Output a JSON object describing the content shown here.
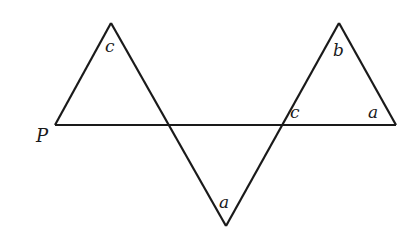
{
  "diagram": {
    "type": "geometry",
    "stroke_color": "#1a1a1a",
    "background": "#ffffff",
    "points": {
      "P": [
        55,
        125
      ],
      "left_apex": [
        111,
        23
      ],
      "left_cross": [
        168,
        125
      ],
      "bottom_vertex": [
        226,
        226
      ],
      "right_cross": [
        284,
        125
      ],
      "right_apex": [
        339,
        23
      ],
      "right_end": [
        396,
        125
      ]
    },
    "labels": {
      "point_p": "P",
      "left_apex_angle": "c",
      "bottom_angle": "a",
      "right_cross_angle": "c",
      "right_apex_angle": "b",
      "right_end_angle": "a"
    }
  }
}
